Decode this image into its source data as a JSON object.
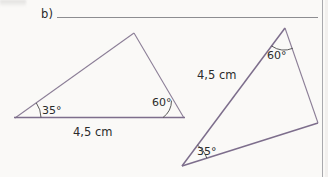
{
  "page": {
    "background_color": "#faf9f7",
    "width": 328,
    "height": 177
  },
  "exercise": {
    "item_label": "b)",
    "answer_blank": ""
  },
  "figures": [
    {
      "name": "triangle-left",
      "vertices": [
        [
          15,
          118
        ],
        [
          134,
          33
        ],
        [
          184,
          118
        ]
      ],
      "stroke_color": "#8c7f97",
      "labels": {
        "angle_left": "35°",
        "angle_right": "60°",
        "side_base": "4,5 cm"
      }
    },
    {
      "name": "triangle-right",
      "vertices": [
        [
          182,
          166
        ],
        [
          285,
          28
        ],
        [
          318,
          123
        ]
      ],
      "stroke_color": "#8c7f97",
      "labels": {
        "angle_bottom_left": "35°",
        "angle_top": "60°",
        "side_left": "4,5 cm"
      }
    }
  ],
  "text": {
    "left_angle_a": "35°",
    "left_angle_b": "60°",
    "left_side": "4,5 cm",
    "right_angle_a": "35°",
    "right_angle_b": "60°",
    "right_side": "4,5 cm"
  }
}
